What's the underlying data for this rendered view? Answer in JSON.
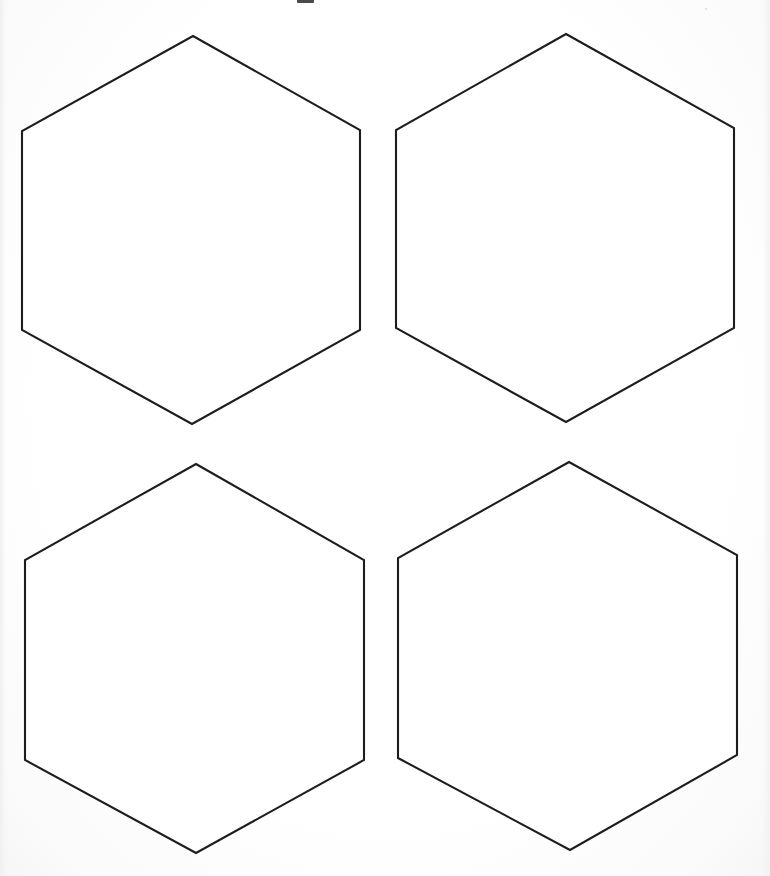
{
  "page": {
    "width": 770,
    "height": 876,
    "background_color": "#ffffff",
    "paper_tint_color": "#fefefe",
    "ink_color": "#1d1d1d",
    "stroke_width": 2.1,
    "shape_count": 4,
    "shape_kind": "hexagon",
    "shape_fill": "#ffffff"
  },
  "shapes": [
    {
      "id": "hexagon-top-left",
      "label": "Hexagon 1",
      "row": 1,
      "column": 1,
      "orientation": "pointy-top",
      "points": "193,36 360,130 360,330 192,424 22,330 22,131",
      "center": {
        "x": 191,
        "y": 230
      },
      "width": 338,
      "height": 388
    },
    {
      "id": "hexagon-top-right",
      "label": "Hexagon 2",
      "row": 1,
      "column": 2,
      "orientation": "pointy-top",
      "points": "566,34 734,128 734,328 566,422 396,328 396,130",
      "center": {
        "x": 565,
        "y": 228
      },
      "width": 338,
      "height": 388
    },
    {
      "id": "hexagon-bottom-left",
      "label": "Hexagon 3",
      "row": 2,
      "column": 1,
      "orientation": "pointy-top",
      "points": "196,464 364,560 364,760 196,853 25,760 25,560",
      "center": {
        "x": 194,
        "y": 658
      },
      "width": 339,
      "height": 389
    },
    {
      "id": "hexagon-bottom-right",
      "label": "Hexagon 4",
      "row": 2,
      "column": 2,
      "orientation": "pointy-top",
      "points": "569,462 737,555 737,755 570,850 398,758 398,558",
      "center": {
        "x": 567,
        "y": 656
      },
      "width": 339,
      "height": 388
    }
  ],
  "artifacts": [
    {
      "id": "scan-artifact-top",
      "kind": "ink-mark",
      "description": "small dark mark clipped by the top edge of the scan",
      "x": 297,
      "y": -4,
      "width": 17,
      "height": 7,
      "color": "#2b2b2b"
    },
    {
      "id": "scan-speck-a",
      "kind": "speck",
      "description": "faint grey speck near the upper right",
      "x": 705,
      "y": 8,
      "width": 2,
      "height": 2,
      "color": "#dcdcdc"
    }
  ]
}
